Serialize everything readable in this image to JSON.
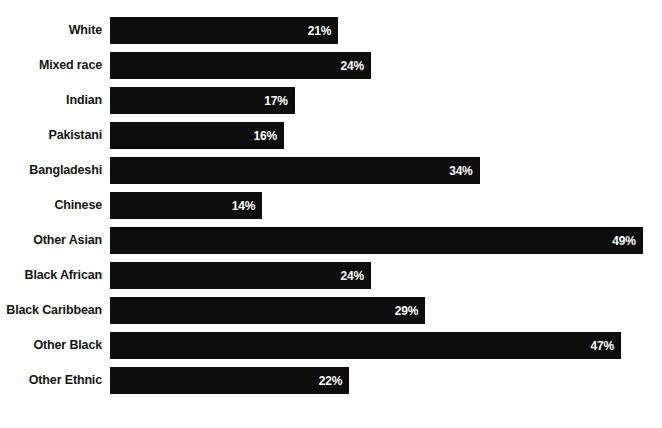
{
  "chart_data": {
    "type": "bar",
    "orientation": "horizontal",
    "title": "",
    "subtitle": "",
    "xlabel": "",
    "ylabel": "",
    "xlim": [
      0,
      50
    ],
    "grid": false,
    "legend": false,
    "value_suffix": "%",
    "categories": [
      "White",
      "Mixed race",
      "Indian",
      "Pakistani",
      "Bangladeshi",
      "Chinese",
      "Other Asian",
      "Black African",
      "Black Caribbean",
      "Other Black",
      "Other Ethnic"
    ],
    "values": [
      21,
      24,
      17,
      16,
      34,
      14,
      49,
      24,
      29,
      47,
      22
    ],
    "data_labels": [
      "21%",
      "24%",
      "17%",
      "16%",
      "34%",
      "14%",
      "49%",
      "24%",
      "29%",
      "47%",
      "22%"
    ],
    "bar_color": "#0d0d0d",
    "label_color": "#141414",
    "value_color": "#ffffff",
    "background": "#ffffff"
  }
}
